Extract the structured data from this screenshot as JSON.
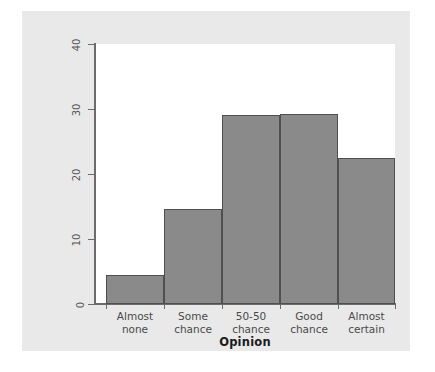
{
  "chart_data": {
    "type": "bar",
    "title": "",
    "subtitle": "",
    "xlabel": "Opinion",
    "ylabel": "Percent of young adults",
    "categories": [
      "Almost\nnone",
      "Some\nchance",
      "50-50\nchance",
      "Good\nchance",
      "Almost\ncertain"
    ],
    "values": [
      4.4,
      14.6,
      29.1,
      29.2,
      22.5
    ],
    "ylim": [
      0,
      40
    ],
    "yticks": [
      0,
      10,
      20,
      30,
      40
    ],
    "ytick_labels": [
      "0",
      "10",
      "20",
      "30",
      "40"
    ],
    "grid": false,
    "legend": null,
    "bar_color": "#8a8a8a",
    "bar_edge_color": "#4f4f4f",
    "panel_color": "#e9e9e9",
    "plot_background": "#ffffff",
    "axis_color": "#6b6b6b",
    "bars_contiguous": true
  }
}
